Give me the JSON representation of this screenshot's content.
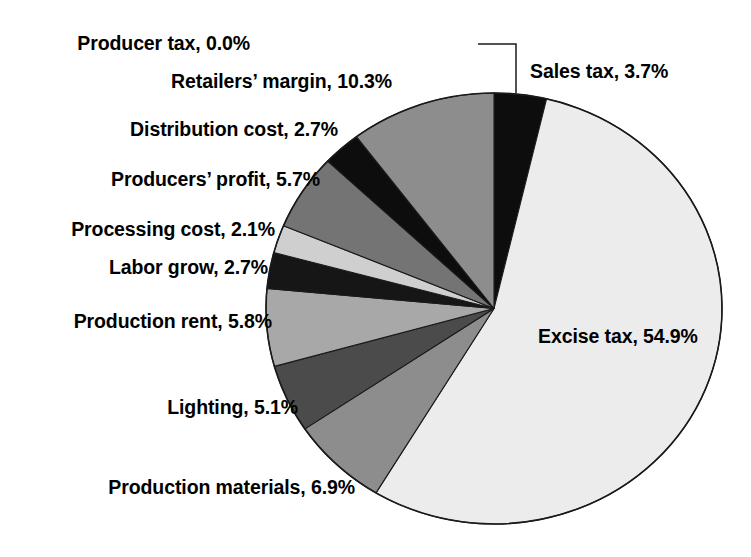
{
  "chart_data": {
    "type": "pie",
    "title": "",
    "subtitle": "",
    "xlabel": "",
    "ylabel": "",
    "legend_position": "none",
    "grid": false,
    "units": "percent",
    "start_angle_deg": 0,
    "direction": "clockwise",
    "categories": [
      "Sales tax",
      "Excise tax",
      "Production materials",
      "Lighting",
      "Production rent",
      "Labor grow",
      "Processing cost",
      "Producers' profit",
      "Distribution cost",
      "Retailers' margin",
      "Producer tax"
    ],
    "values": [
      3.7,
      54.9,
      6.9,
      5.1,
      5.8,
      2.7,
      2.1,
      5.7,
      2.7,
      10.3,
      0.0
    ],
    "slices": [
      {
        "name": "Sales tax",
        "value": 3.7,
        "label": "Sales tax, 3.7%",
        "color": "#0d0d0d"
      },
      {
        "name": "Excise tax",
        "value": 54.9,
        "label": "Excise tax, 54.9%",
        "color": "#ececec"
      },
      {
        "name": "Production materials",
        "value": 6.9,
        "label": "Production materials, 6.9%",
        "color": "#8d8d8d"
      },
      {
        "name": "Lighting",
        "value": 5.1,
        "label": "Lighting, 5.1%",
        "color": "#4b4b4b"
      },
      {
        "name": "Production rent",
        "value": 5.8,
        "label": "Production rent, 5.8%",
        "color": "#a8a8a8"
      },
      {
        "name": "Labor grow",
        "value": 2.7,
        "label": "Labor grow, 2.7%",
        "color": "#161616"
      },
      {
        "name": "Processing cost",
        "value": 2.1,
        "label": "Processing cost, 2.1%",
        "color": "#cfcfcf"
      },
      {
        "name": "Producers' profit",
        "value": 5.7,
        "label": "Producers’ profit, 5.7%",
        "color": "#747474"
      },
      {
        "name": "Distribution cost",
        "value": 2.7,
        "label": "Distribution cost, 2.7%",
        "color": "#0d0d0d"
      },
      {
        "name": "Retailers' margin",
        "value": 10.3,
        "label": "Retailers’ margin, 10.3%",
        "color": "#8d8d8d"
      },
      {
        "name": "Producer tax",
        "value": 0.0,
        "label": "Producer tax, 0.0%",
        "color": "#000000"
      }
    ],
    "total": 100.0,
    "outline_color": "#1a1a1a",
    "background_color": "#ffffff",
    "text_color": "#000000"
  },
  "labels": {
    "producer_tax": "Producer tax, 0.0%",
    "sales_tax": "Sales tax, 3.7%",
    "retailers_margin": "Retailers’ margin, 10.3%",
    "distribution_cost": "Distribution cost, 2.7%",
    "producers_profit": "Producers’ profit, 5.7%",
    "processing_cost": "Processing cost, 2.1%",
    "labor_grow": "Labor grow, 2.7%",
    "production_rent": "Production rent, 5.8%",
    "lighting": "Lighting, 5.1%",
    "production_materials": "Production materials, 6.9%",
    "excise_tax": "Excise tax, 54.9%"
  }
}
